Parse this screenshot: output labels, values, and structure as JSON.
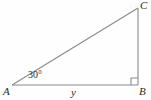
{
  "figure": {
    "type": "right-triangle-diagram",
    "background_color": "#fefefe",
    "stroke_color": "#8a8a8a",
    "text_color": "#2b2b2b",
    "vertices": {
      "A": {
        "label": "A",
        "x": 12,
        "y": 85
      },
      "B": {
        "label": "B",
        "x": 138,
        "y": 85
      },
      "C": {
        "label": "C",
        "x": 138,
        "y": 8
      }
    },
    "angles": {
      "at_A": {
        "label": "30°",
        "value": 30,
        "unit": "degrees"
      },
      "at_B": {
        "label": "",
        "value": 90,
        "unit": "degrees",
        "marker": "right-angle-square"
      }
    },
    "sides": {
      "AB": {
        "label": "y",
        "role": "adjacent-base"
      },
      "BC": {
        "label": "",
        "role": "opposite-vertical"
      },
      "AC": {
        "label": "",
        "role": "hypotenuse"
      }
    },
    "right_angle_marker": {
      "size": 7,
      "corner": "B"
    }
  }
}
